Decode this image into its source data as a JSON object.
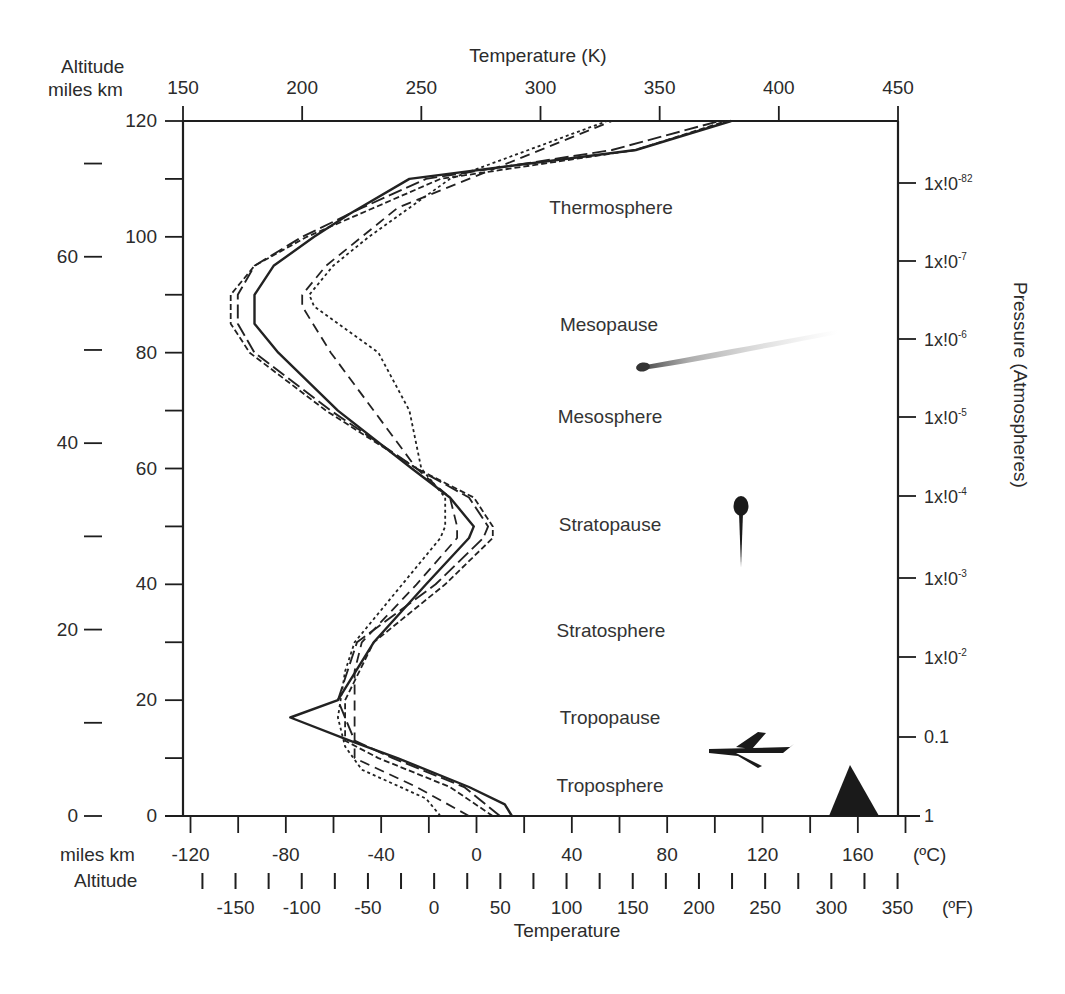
{
  "chart_data": {
    "type": "line",
    "title": "",
    "top_axis": {
      "label": "Temperature (K)",
      "ticks": [
        "150",
        "200",
        "250",
        "300",
        "350",
        "400",
        "450"
      ],
      "range": [
        150,
        450
      ]
    },
    "bottom_axis_celsius": {
      "unit_label": "(ºC)",
      "ticks": [
        "-120",
        "-80",
        "-40",
        "0",
        "40",
        "80",
        "120",
        "160"
      ]
    },
    "bottom_axis_fahrenheit": {
      "unit_label": "(ºF)",
      "ticks": [
        "-150",
        "-100",
        "-50",
        "0",
        "50",
        "100",
        "150",
        "200",
        "250",
        "300",
        "350"
      ]
    },
    "xlabel": "Temperature",
    "left_axis": {
      "header_line1": "Altitude",
      "header_line2": "miles  km",
      "footer_line1": "miles  km",
      "footer_line2": "Altitude",
      "km_ticks": [
        "120",
        "100",
        "80",
        "60",
        "40",
        "20",
        "0"
      ],
      "mile_ticks": [
        "60",
        "40",
        "20",
        "0"
      ],
      "range_km": [
        0,
        120
      ]
    },
    "right_axis": {
      "label": "Pressure (Atmospheres)",
      "ticks": [
        {
          "base": "1x!0",
          "exp": "-82"
        },
        {
          "base": "1x!0",
          "exp": "-7"
        },
        {
          "base": "1x!0",
          "exp": "-6"
        },
        {
          "base": "1x!0",
          "exp": "-5"
        },
        {
          "base": "1x!0",
          "exp": "-4"
        },
        {
          "base": "1x!0",
          "exp": "-3"
        },
        {
          "base": "1x!0",
          "exp": "-2"
        },
        {
          "base": "0.1",
          "exp": ""
        },
        {
          "base": "1",
          "exp": ""
        }
      ]
    },
    "regions": [
      "Thermosphere",
      "Mesopause",
      "Mesosphere",
      "Stratopause",
      "Stratosphere",
      "Tropopause",
      "Troposphere"
    ],
    "series": [
      {
        "name": "solid",
        "style": "solid",
        "altitude_km": [
          0,
          2,
          5,
          10,
          13,
          17,
          20,
          30,
          40,
          48,
          50,
          55,
          60,
          70,
          80,
          85,
          90,
          95,
          100,
          104,
          110,
          115,
          120
        ],
        "temperature_K": [
          288,
          285,
          270,
          240,
          220,
          195,
          215,
          230,
          252,
          270,
          272,
          262,
          246,
          215,
          190,
          180,
          180,
          188,
          205,
          220,
          245,
          340,
          380
        ]
      },
      {
        "name": "long-dash",
        "style": "dashed-long",
        "altitude_km": [
          0,
          5,
          10,
          13,
          20,
          30,
          40,
          48,
          50,
          55,
          60,
          70,
          80,
          85,
          90,
          95,
          100,
          105,
          110,
          115,
          120
        ],
        "temperature_K": [
          283,
          268,
          238,
          222,
          215,
          223,
          256,
          276,
          278,
          270,
          248,
          212,
          180,
          173,
          173,
          180,
          200,
          225,
          252,
          330,
          375
        ]
      },
      {
        "name": "short-dash",
        "style": "dashed-short",
        "altitude_km": [
          0,
          5,
          10,
          13,
          20,
          30,
          40,
          48,
          50,
          55,
          60,
          70,
          80,
          85,
          90,
          95,
          100,
          105,
          110,
          115,
          120
        ],
        "temperature_K": [
          280,
          262,
          232,
          218,
          218,
          230,
          260,
          280,
          280,
          272,
          248,
          210,
          178,
          170,
          170,
          180,
          202,
          230,
          258,
          340,
          378
        ]
      },
      {
        "name": "medium-dash",
        "style": "dashed-medium",
        "altitude_km": [
          0,
          5,
          10,
          13,
          20,
          25,
          30,
          40,
          48,
          50,
          55,
          60,
          70,
          80,
          88,
          90,
          95,
          100,
          105,
          110,
          120
        ],
        "temperature_K": [
          270,
          248,
          222,
          222,
          222,
          222,
          225,
          248,
          265,
          265,
          262,
          248,
          230,
          212,
          200,
          200,
          210,
          225,
          240,
          270,
          330
        ]
      },
      {
        "name": "dotted",
        "style": "dotted",
        "altitude_km": [
          0,
          3,
          8,
          12,
          17,
          25,
          30,
          40,
          48,
          50,
          55,
          60,
          70,
          80,
          88,
          90,
          95,
          100,
          105,
          110,
          120
        ],
        "temperature_K": [
          258,
          252,
          225,
          218,
          215,
          218,
          222,
          242,
          258,
          260,
          260,
          250,
          245,
          232,
          205,
          203,
          213,
          228,
          245,
          262,
          328
        ]
      }
    ],
    "annotations": [
      {
        "icon": "meteor",
        "altitude_km": 78
      },
      {
        "icon": "balloon",
        "altitude_km": 50
      },
      {
        "icon": "airplane",
        "altitude_km": 11
      },
      {
        "icon": "mountain",
        "altitude_km": 8
      }
    ],
    "grid": false
  },
  "labels": {
    "top_title": "Temperature (K)",
    "alt_header1": "Altitude",
    "alt_header2": "miles  km",
    "alt_footer1": "miles  km",
    "alt_footer2": "Altitude",
    "bottom_title": "Temperature",
    "celsius_unit": "(ºC)",
    "fahrenheit_unit": "(ºF)",
    "pressure_title": "Pressure (Atmospheres)"
  }
}
